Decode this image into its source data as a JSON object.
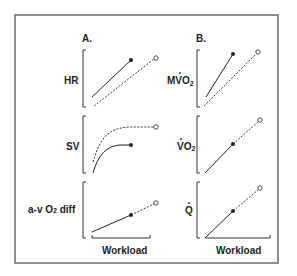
{
  "figure": {
    "panels": [
      {
        "label": "A.",
        "xlabel": "Workload",
        "plots": [
          {
            "ylabel": "HR"
          },
          {
            "ylabel": "SV"
          },
          {
            "ylabel_main": "a-v O",
            "ylabel_sub": "2",
            "ylabel_tail": " diff"
          }
        ]
      },
      {
        "label": "B.",
        "xlabel": "Workload",
        "plots": [
          {
            "ylabel_main": "MVO",
            "ylabel_sub": "2",
            "dot": true
          },
          {
            "ylabel_main": "VO",
            "ylabel_sub": "2",
            "dot": true
          },
          {
            "ylabel_main": "Q",
            "ylabel_sub": "",
            "dot": true
          }
        ]
      }
    ],
    "legend_semantics": {
      "solid_line_filled_dot": "Condition 1 (solid)",
      "dashed_line_open_circle": "Condition 2 (dashed)"
    },
    "colors": {
      "frame": "#555555",
      "line": "#222222",
      "background": "#ffffff"
    }
  }
}
